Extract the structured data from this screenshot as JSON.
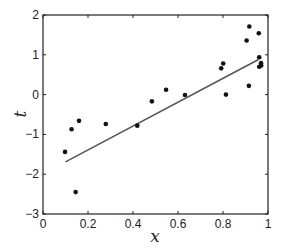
{
  "chart_data": {
    "type": "scatter",
    "title": "",
    "xlabel": "x",
    "ylabel": "t",
    "xlim": [
      0,
      1
    ],
    "ylim": [
      -3,
      2
    ],
    "grid": false,
    "legend": null,
    "x_ticks": [
      0,
      0.2,
      0.4,
      0.6,
      0.8,
      1
    ],
    "x_tick_labels": [
      "0",
      "0.2",
      "0.4",
      "0.6",
      "0.8",
      "1"
    ],
    "y_ticks": [
      2,
      1,
      0,
      -1,
      -2,
      -3
    ],
    "y_tick_labels": [
      "2",
      "1",
      "0",
      "−1",
      "−2",
      "−3"
    ],
    "series": [
      {
        "name": "data points",
        "type": "scatter",
        "marker": "filled-circle",
        "color": "#111111",
        "x": [
          0.098,
          0.127,
          0.145,
          0.16,
          0.279,
          0.419,
          0.484,
          0.547,
          0.631,
          0.792,
          0.801,
          0.813,
          0.905,
          0.915,
          0.917,
          0.959,
          0.961,
          0.961,
          0.969,
          0.97
        ],
        "y": [
          -1.44,
          -0.87,
          -2.45,
          -0.66,
          -0.74,
          -0.78,
          -0.17,
          0.12,
          -0.01,
          0.66,
          0.78,
          0.0,
          1.36,
          0.22,
          1.71,
          1.54,
          0.94,
          0.7,
          0.79,
          0.73
        ]
      },
      {
        "name": "linear fit",
        "type": "line",
        "color": "#555555",
        "x": [
          0.1,
          0.958
        ],
        "y": [
          -1.69,
          0.88
        ]
      }
    ]
  }
}
